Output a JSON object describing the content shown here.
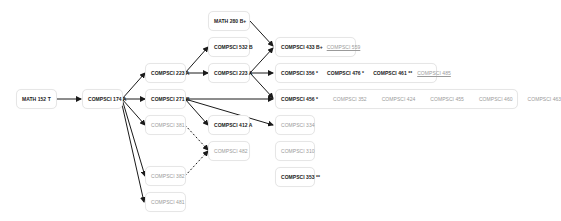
{
  "diagram": {
    "type": "course-prerequisite-graph",
    "colors": {
      "taken_text": "#1a1a1a",
      "untaken_text": "#9a9a9a",
      "edge": "#1a1a1a",
      "node_border": "#e6e6e6"
    },
    "nodes": [
      {
        "id": "math152",
        "courses": [
          {
            "label": "MATH 152 T",
            "taken": true
          }
        ]
      },
      {
        "id": "cs174",
        "courses": [
          {
            "label": "COMPSCI 174 A",
            "taken": true
          }
        ]
      },
      {
        "id": "math280",
        "courses": [
          {
            "label": "MATH 280 B+",
            "taken": true
          }
        ]
      },
      {
        "id": "cs532",
        "courses": [
          {
            "label": "COMPSCI 532 B",
            "taken": true
          }
        ]
      },
      {
        "id": "cs223",
        "courses": [
          {
            "label": "COMPSCI 223 A",
            "taken": true
          }
        ]
      },
      {
        "id": "cs323",
        "courses": [
          {
            "label": "COMPSCI 223 A",
            "taken": true
          }
        ]
      },
      {
        "id": "cs271",
        "courses": [
          {
            "label": "COMPSCI 271 B",
            "taken": true
          }
        ]
      },
      {
        "id": "cs381",
        "courses": [
          {
            "label": "COMPSCI 381",
            "taken": false
          }
        ]
      },
      {
        "id": "cs412",
        "courses": [
          {
            "label": "COMPSCI 412 A",
            "taken": true
          }
        ]
      },
      {
        "id": "cs482",
        "courses": [
          {
            "label": "COMPSCI 482",
            "taken": false
          }
        ]
      },
      {
        "id": "cs382",
        "courses": [
          {
            "label": "COMPSCI 382",
            "taken": false
          }
        ]
      },
      {
        "id": "cs481",
        "courses": [
          {
            "label": "COMPSCI 481",
            "taken": false
          }
        ]
      },
      {
        "id": "row433",
        "courses": [
          {
            "label": "COMPSCI 433 B+",
            "taken": true
          },
          {
            "label": "COMPSCI 559",
            "taken": false,
            "link": true
          }
        ]
      },
      {
        "id": "row356",
        "courses": [
          {
            "label": "COMPSCI 356 *",
            "taken": true
          },
          {
            "label": "COMPSCI 476 *",
            "taken": true
          },
          {
            "label": "COMPSCI 461 **",
            "taken": true
          },
          {
            "label": "COMPSCI 485",
            "taken": false,
            "link": true
          }
        ]
      },
      {
        "id": "row456",
        "courses": [
          {
            "label": "COMPSCI 456 *",
            "taken": true
          },
          {
            "label": "COMPSCI 352",
            "taken": false
          },
          {
            "label": "COMPSCI 424",
            "taken": false
          },
          {
            "label": "COMPSCI 455",
            "taken": false
          },
          {
            "label": "COMPSCI 460",
            "taken": false
          },
          {
            "label": "COMPSCI 463",
            "taken": false
          }
        ]
      },
      {
        "id": "cs334",
        "courses": [
          {
            "label": "COMPSCI 334",
            "taken": false
          }
        ]
      },
      {
        "id": "cs310",
        "courses": [
          {
            "label": "COMPSCI 310",
            "taken": false
          }
        ]
      },
      {
        "id": "cs353",
        "courses": [
          {
            "label": "COMPSCI 353 **",
            "taken": true
          }
        ]
      }
    ],
    "edges": [
      {
        "from": "math152",
        "to": "cs174",
        "style": "solid"
      },
      {
        "from": "cs174",
        "to": "cs223",
        "style": "solid"
      },
      {
        "from": "cs174",
        "to": "cs271",
        "style": "solid"
      },
      {
        "from": "cs174",
        "to": "cs381",
        "style": "solid"
      },
      {
        "from": "cs174",
        "to": "cs382",
        "style": "solid"
      },
      {
        "from": "cs174",
        "to": "cs481",
        "style": "solid"
      },
      {
        "from": "cs223",
        "to": "cs532",
        "style": "solid"
      },
      {
        "from": "cs223",
        "to": "cs323",
        "style": "solid"
      },
      {
        "from": "math280",
        "to": "row433",
        "style": "solid"
      },
      {
        "from": "cs323",
        "to": "row433",
        "style": "solid"
      },
      {
        "from": "cs323",
        "to": "row356",
        "style": "solid"
      },
      {
        "from": "cs323",
        "to": "row456",
        "style": "solid"
      },
      {
        "from": "cs271",
        "to": "row456",
        "style": "solid"
      },
      {
        "from": "cs271",
        "to": "cs412",
        "style": "solid"
      },
      {
        "from": "cs271",
        "to": "cs334",
        "style": "solid"
      },
      {
        "from": "cs381",
        "to": "cs482",
        "style": "dashed"
      },
      {
        "from": "cs382",
        "to": "cs482",
        "style": "dashed"
      }
    ]
  }
}
